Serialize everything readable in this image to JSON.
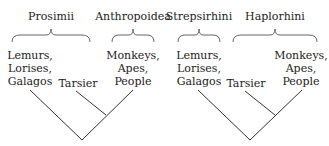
{
  "diagrams": [
    {
      "id": "left",
      "groups": [
        {
          "label": "Prosimii",
          "x": 51,
          "brace": [
            12,
            90
          ]
        },
        {
          "label": "Anthropoidea",
          "x": 133,
          "brace": [
            112,
            154
          ]
        }
      ],
      "taxa": [
        {
          "lines": [
            "Lemurs,",
            "Lorises,",
            "Galagos"
          ],
          "x": 30
        },
        {
          "lines": [
            "Tarsier"
          ],
          "x": 78
        },
        {
          "lines": [
            "Monkeys,",
            "Apes,",
            "People"
          ],
          "x": 133
        }
      ]
    },
    {
      "id": "right",
      "groups": [
        {
          "label": "Strepsirhini",
          "x": 199,
          "brace": [
            178,
            220
          ]
        },
        {
          "label": "Haplorhini",
          "x": 275,
          "brace": [
            233,
            317
          ]
        }
      ],
      "taxa": [
        {
          "lines": [
            "Lemurs,",
            "Lorises,",
            "Galagos"
          ],
          "x": 199
        },
        {
          "lines": [
            "Tarsier"
          ],
          "x": 246
        },
        {
          "lines": [
            "Monkeys,",
            "Apes,",
            "People"
          ],
          "x": 301
        }
      ]
    }
  ]
}
